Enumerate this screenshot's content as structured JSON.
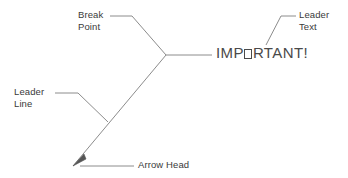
{
  "diagram": {
    "background_color": "#ffffff",
    "line_color": "#8c8c8c",
    "text_color": "#3a3a3a",
    "main_text_color": "#4a4a4a",
    "main_text": {
      "full": "IMPORTANT!",
      "before_box": "IMP",
      "after_box": "RTANT!",
      "missing_glyph_note": "O rendered as empty box"
    },
    "labels": {
      "break_point": {
        "line1": "Break",
        "line2": "Point"
      },
      "leader_text": {
        "line1": "Leader",
        "line2": "Text"
      },
      "leader_line": {
        "line1": "Leader",
        "line2": "Line"
      },
      "arrow_head": {
        "line1": "Arrow Head"
      }
    },
    "geometry": {
      "arrow_tip": [
        73,
        166
      ],
      "break_point": [
        166,
        55
      ],
      "landing_end": [
        212,
        55
      ],
      "leader_line_junction": [
        108,
        122
      ],
      "leader_text_anchor": [
        266,
        45
      ]
    }
  }
}
